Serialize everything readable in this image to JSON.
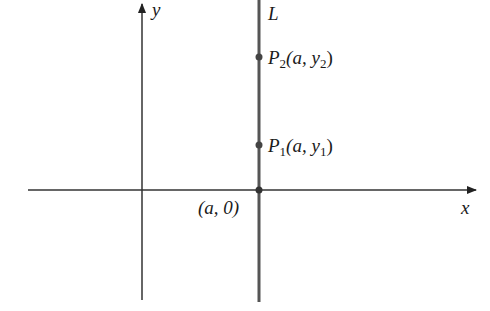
{
  "diagram": {
    "axes": {
      "x_label": "x",
      "y_label": "y"
    },
    "line": {
      "label": "L"
    },
    "points": [
      {
        "name": "P",
        "sub": "2",
        "coords_prefix": "(a, y",
        "coords_sub": "2",
        "coords_suffix": ")"
      },
      {
        "name": "P",
        "sub": "1",
        "coords_prefix": "(a, y",
        "coords_sub": "1",
        "coords_suffix": ")"
      }
    ],
    "intercept_label": "(a, 0)",
    "colors": {
      "stroke": "#333333",
      "line_L": "#555555",
      "point": "#444444"
    }
  }
}
